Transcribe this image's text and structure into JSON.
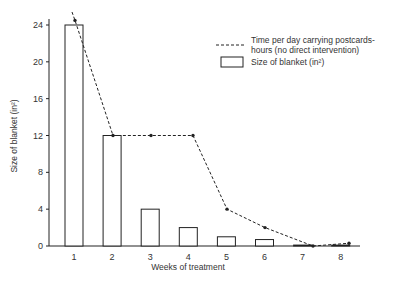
{
  "chart_data": {
    "type": "bar",
    "title": "",
    "xlabel": "Weeks of treatment",
    "ylabel": "Size of blanket (in²)",
    "ylim": [
      0,
      24
    ],
    "yticks": [
      0,
      4,
      8,
      12,
      16,
      20,
      24
    ],
    "categories": [
      "1",
      "2",
      "3",
      "4",
      "5",
      "6",
      "7",
      "8"
    ],
    "grid": false,
    "legend_position": "upper right",
    "series": [
      {
        "name": "Size of blanket (in²)",
        "type": "bar",
        "values": [
          24,
          12,
          4,
          2,
          1,
          0.7,
          0.1,
          0.1
        ]
      },
      {
        "name": "Time per day carrying postcards-hours (no direct intervention)",
        "type": "line",
        "style": "dashed",
        "values": [
          24.5,
          12,
          12,
          12,
          4,
          2,
          0,
          0.3
        ]
      }
    ]
  },
  "legend": {
    "line_label_1": "Time per day carrying postcards-",
    "line_label_2": "hours (no direct intervention)",
    "bar_label": "Size of blanket (in²)"
  },
  "axes": {
    "xlabel": "Weeks of treatment",
    "ylabel": "Size of blanket (in²)"
  },
  "colors": {
    "ink": "#222222",
    "background": "#ffffff"
  }
}
